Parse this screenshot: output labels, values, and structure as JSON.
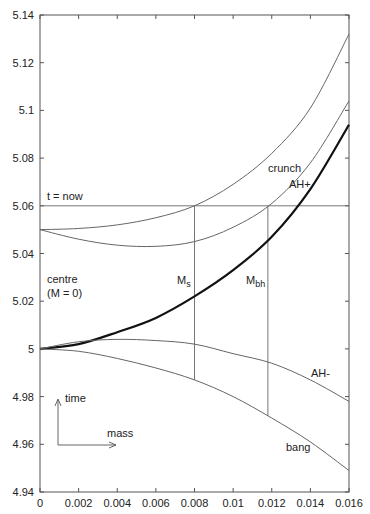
{
  "chart_data": {
    "type": "line",
    "title": "",
    "xlabel": "",
    "ylabel": "",
    "xlim": [
      0,
      0.016
    ],
    "ylim": [
      4.94,
      5.14
    ],
    "grid": false,
    "legend": "none (curves labelled inline)",
    "x_ticks": [
      "0",
      "0.002",
      "0.004",
      "0.006",
      "0.008",
      "0.01",
      "0.012",
      "0.014",
      "0.016"
    ],
    "y_ticks": [
      "4.94",
      "4.96",
      "4.98",
      "5",
      "5.02",
      "5.04",
      "5.06",
      "5.08",
      "5.1",
      "5.12",
      "5.14"
    ],
    "x": [
      0,
      0.002,
      0.004,
      0.006,
      0.008,
      0.01,
      0.012,
      0.014,
      0.016
    ],
    "series": [
      {
        "name": "crunch",
        "width": 1,
        "values": [
          5.05,
          5.0505,
          5.052,
          5.055,
          5.06,
          5.069,
          5.082,
          5.101,
          5.132
        ]
      },
      {
        "name": "AH+",
        "width": 1,
        "values": [
          5.05,
          5.046,
          5.0435,
          5.043,
          5.045,
          5.051,
          5.061,
          5.078,
          5.104
        ]
      },
      {
        "name": "centre (M = 0)",
        "width": 2.2,
        "values": [
          5.0,
          5.002,
          5.007,
          5.013,
          5.022,
          5.033,
          5.047,
          5.067,
          5.094
        ]
      },
      {
        "name": "AH-",
        "width": 1,
        "values": [
          5.0,
          5.003,
          5.004,
          5.0035,
          5.002,
          4.998,
          4.994,
          4.987,
          4.978
        ]
      },
      {
        "name": "bang",
        "width": 1,
        "values": [
          5.0,
          4.999,
          4.996,
          4.992,
          4.987,
          4.98,
          4.971,
          4.961,
          4.949
        ]
      }
    ],
    "reference_lines": [
      {
        "name": "t = now",
        "orientation": "horizontal",
        "y": 5.06,
        "x_range": [
          0,
          0.016
        ]
      },
      {
        "name": "Ms",
        "orientation": "vertical",
        "x": 0.008,
        "y_range": [
          4.987,
          5.06
        ]
      },
      {
        "name": "Mbh",
        "orientation": "vertical",
        "x": 0.0118,
        "y_range": [
          4.972,
          5.06
        ]
      }
    ],
    "annotations": [
      {
        "text": "crunch",
        "x": 0.0125,
        "y": 5.095
      },
      {
        "text": "AH+",
        "x": 0.0137,
        "y": 5.075
      },
      {
        "text": "t = now",
        "x": 0.0005,
        "y": 5.062
      },
      {
        "text": "centre",
        "x": 0.0005,
        "y": 5.028
      },
      {
        "text": "(M = 0)",
        "x": 0.0005,
        "y": 5.021
      },
      {
        "text": "Ms",
        "x": 0.0071,
        "y": 5.025
      },
      {
        "text": "Mbh",
        "x": 0.01,
        "y": 5.025
      },
      {
        "text": "AH-",
        "x": 0.0137,
        "y": 4.988
      },
      {
        "text": "bang",
        "x": 0.0125,
        "y": 4.956
      },
      {
        "text": "time",
        "x": 0.0011,
        "y": 4.974
      },
      {
        "text": "mass",
        "x": 0.0025,
        "y": 4.961
      }
    ]
  },
  "labels": {
    "crunch": "crunch",
    "ah_plus": "AH+",
    "t_now": "t = now",
    "centre_1": "centre",
    "centre_2": "(M = 0)",
    "ms_main": "M",
    "ms_sub": "s",
    "mbh_main": "M",
    "mbh_sub": "bh",
    "ah_minus": "AH-",
    "bang": "bang",
    "time": "time",
    "mass": "mass"
  }
}
